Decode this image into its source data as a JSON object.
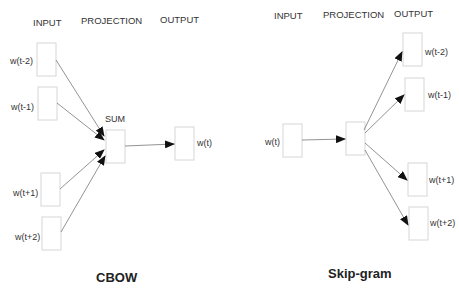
{
  "cbow": {
    "title": "CBOW",
    "headers": {
      "input": "INPUT",
      "projection": "PROJECTION",
      "output": "OUTPUT"
    },
    "projection_label": "SUM",
    "inputs": [
      "w(t-2)",
      "w(t-1)",
      "w(t+1)",
      "w(t+2)"
    ],
    "output": "w(t)"
  },
  "skipgram": {
    "title": "Skip-gram",
    "headers": {
      "input": "INPUT",
      "projection": "PROJECTION",
      "output": "OUTPUT"
    },
    "input": "w(t)",
    "outputs": [
      "w(t-2)",
      "w(t-1)",
      "w(t+1)",
      "w(t+2)"
    ]
  }
}
